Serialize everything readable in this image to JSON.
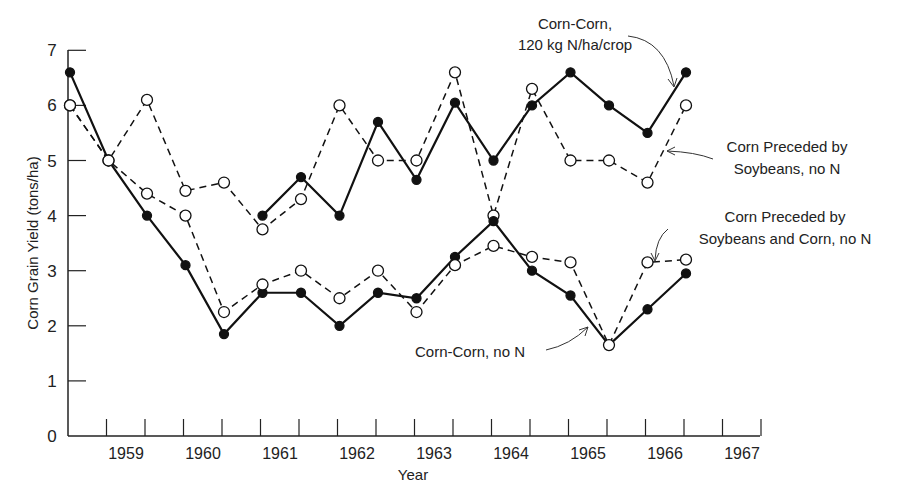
{
  "chart_data": {
    "type": "line",
    "title": "",
    "xlabel": "Year",
    "ylabel": "Corn Grain Yield (tons/ha)",
    "ylim": [
      0,
      7
    ],
    "yticks": [
      "0",
      "1",
      "2",
      "3",
      "4",
      "5",
      "6",
      "7"
    ],
    "xtick_labels": [
      "1959",
      "1960",
      "1961",
      "1962",
      "1963",
      "1964",
      "1965",
      "1966",
      "1967"
    ],
    "grid": false,
    "x": [
      1958.3,
      1958.8,
      1959.3,
      1959.8,
      1960.3,
      1960.8,
      1961.3,
      1961.8,
      1962.3,
      1962.8,
      1963.3,
      1963.8,
      1964.3,
      1964.8,
      1965.3,
      1965.8,
      1966.3
    ],
    "series": [
      {
        "name": "Corn-Corn, 120 kg N/ha/crop",
        "style": "solid-filled",
        "values": [
          6.6,
          5.0,
          4.0,
          3.1,
          1.85,
          4.0,
          4.7,
          4.0,
          5.7,
          4.65,
          6.05,
          5.0,
          6.0,
          6.6,
          6.0,
          5.5,
          6.6
        ]
      },
      {
        "name": "Corn Preceded by Soybeans, no N",
        "style": "dashed-open",
        "values": [
          6.0,
          5.0,
          6.1,
          4.45,
          4.6,
          3.75,
          4.3,
          6.0,
          5.0,
          5.0,
          6.6,
          4.0,
          6.3,
          5.0,
          5.0,
          4.6,
          6.0
        ]
      },
      {
        "name": "Corn-Corn, no N",
        "style": "solid-filled",
        "values": [
          6.6,
          5.0,
          4.0,
          3.1,
          1.85,
          2.6,
          2.6,
          2.0,
          2.6,
          2.5,
          3.25,
          3.9,
          3.0,
          2.55,
          1.65,
          2.3,
          2.95
        ]
      },
      {
        "name": "Corn Preceded by Soybeans and Corn, no N",
        "style": "dashed-open",
        "values": [
          6.0,
          5.0,
          4.4,
          4.0,
          2.25,
          2.75,
          3.0,
          2.5,
          3.0,
          2.25,
          3.1,
          3.45,
          3.25,
          3.15,
          1.65,
          3.15,
          3.2
        ]
      }
    ],
    "annotations": [
      {
        "text": "Corn-Corn,",
        "text2": "120 kg N/ha/crop"
      },
      {
        "text": "Corn Preceded by",
        "text2": "Soybeans, no N"
      },
      {
        "text": "Corn Preceded by",
        "text2": "Soybeans and Corn, no N"
      },
      {
        "text": "Corn-Corn, no N"
      }
    ]
  }
}
